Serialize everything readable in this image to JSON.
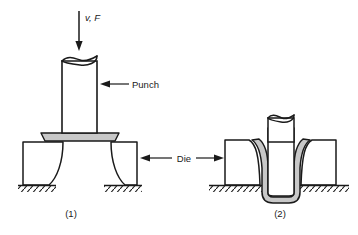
{
  "figure": {
    "captions": [
      {
        "id": "stage-1",
        "label": "(1)"
      },
      {
        "id": "stage-2",
        "label": "(2)"
      }
    ],
    "annotations": [
      {
        "id": "force-label",
        "text": "v, F",
        "style": "italic",
        "describes": "punch velocity and force"
      },
      {
        "id": "punch-label",
        "text": "Punch",
        "style": "regular",
        "describes": "cylindrical punch tool"
      },
      {
        "id": "die-label",
        "text": "Die",
        "style": "regular",
        "describes": "die blocks on both sides"
      }
    ],
    "colors": {
      "outline": "#1a1a1a",
      "sheet_fill": "#c8c8c8",
      "sheet_fill_light": "#d6d6d6",
      "tool_fill": "#ffffff",
      "background": "#ffffff",
      "hatch": "#1a1a1a"
    },
    "parts": [
      {
        "id": "punch-1",
        "name": "punch",
        "stage": 1
      },
      {
        "id": "blank-1",
        "name": "sheet-metal-blank",
        "stage": 1
      },
      {
        "id": "die-left-1",
        "name": "die-block-left",
        "stage": 1
      },
      {
        "id": "die-right-1",
        "name": "die-block-right",
        "stage": 1
      },
      {
        "id": "punch-2",
        "name": "punch",
        "stage": 2
      },
      {
        "id": "cup-2",
        "name": "drawn-cup",
        "stage": 2
      },
      {
        "id": "die-left-2",
        "name": "die-block-left",
        "stage": 2
      },
      {
        "id": "die-right-2",
        "name": "die-block-right",
        "stage": 2
      }
    ]
  }
}
